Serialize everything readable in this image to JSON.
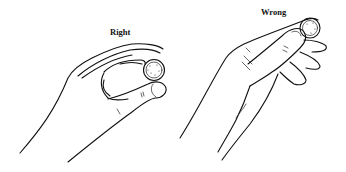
{
  "figure": {
    "panels": [
      {
        "label": "Right",
        "subject": "hand gripping coin between thumb and index finger pads"
      },
      {
        "label": "Wrong",
        "subject": "hand gripping coin with fingertip pressed on top"
      }
    ],
    "colors": {
      "line": "#111111",
      "background": "#ffffff"
    }
  }
}
